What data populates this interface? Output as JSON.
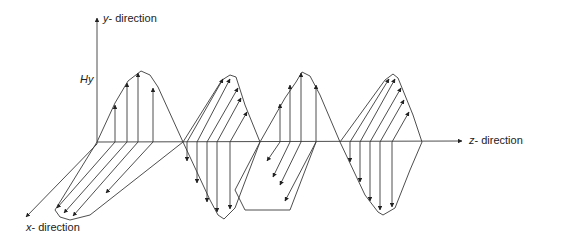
{
  "diagram": {
    "title": "",
    "axes": {
      "y": {
        "label_var": "y",
        "label_rest": "- direction"
      },
      "z": {
        "label_var": "z",
        "label_rest": "- direction"
      },
      "x": {
        "label_var": "x",
        "label_rest": "- direction"
      }
    },
    "field_label": "Hy",
    "colors": {
      "line": "#3a3a3a",
      "background": "#ffffff"
    }
  }
}
